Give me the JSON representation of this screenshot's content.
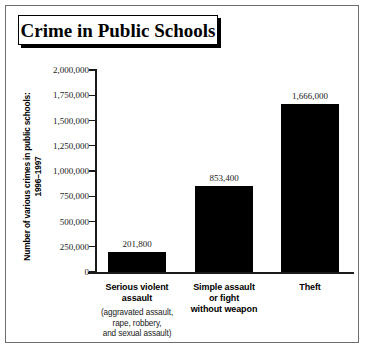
{
  "figure": {
    "title": "Crime in Public Schools"
  },
  "chart_data": {
    "type": "bar",
    "title": "Crime in Public Schools",
    "xlabel": "",
    "ylabel": "Number of various crimes in public schools: 1996–1997",
    "ylabel_lines": [
      "Number of various crimes in public schools:",
      "1996–1997"
    ],
    "categories": [
      "Serious violent assault",
      "Simple assault or fight without weapon",
      "Theft"
    ],
    "category_lines": [
      [
        "Serious violent",
        "assault"
      ],
      [
        "Simple assault",
        "or fight",
        "without weapon"
      ],
      [
        "Theft"
      ]
    ],
    "category_sublabels": [
      [
        "(aggravated assault,",
        "rape, robbery,",
        "and sexual assault)"
      ],
      [],
      []
    ],
    "values": [
      201800,
      853400,
      1666000
    ],
    "value_labels": [
      "201,800",
      "853,400",
      "1,666,000"
    ],
    "ylim": [
      0,
      2000000
    ],
    "ytick_values": [
      0,
      250000,
      500000,
      750000,
      1000000,
      1250000,
      1500000,
      1750000,
      2000000
    ],
    "ytick_labels": [
      "0",
      "250,000",
      "500,000",
      "750,000",
      "1,000,000",
      "1,250,000",
      "1,500,000",
      "1,750,000",
      "2,000,000"
    ],
    "grid": false,
    "legend": null,
    "bar_color": "#000000",
    "axis_color": "#1a1a1a",
    "background_color": "#ffffff"
  }
}
